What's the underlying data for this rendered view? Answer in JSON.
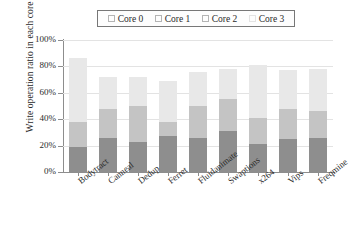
{
  "chart_data": {
    "type": "bar",
    "stacked": true,
    "title": "",
    "xlabel": "",
    "ylabel": "Write operation ratio in each core",
    "ylim": [
      0,
      100
    ],
    "yticks": [
      "0%",
      "20%",
      "40%",
      "60%",
      "80%",
      "100%"
    ],
    "grid": true,
    "legend_position": "top",
    "categories": [
      "Bodytract",
      "Canneal",
      "Dedup",
      "Ferret",
      "Fluidanimate",
      "Swaptions",
      "x264",
      "Vips",
      "Freqmine"
    ],
    "series": [
      {
        "name": "Core 0",
        "color": "#8e8e8e",
        "values": [
          19,
          26,
          23,
          27,
          26,
          31,
          21,
          25,
          26
        ]
      },
      {
        "name": "Core 1",
        "color": "#c4c4c4",
        "values": [
          19,
          22,
          27,
          11,
          24,
          24,
          20,
          23,
          20
        ]
      },
      {
        "name": "Core 2",
        "color": "#e8e8e8",
        "values": [
          48,
          24,
          22,
          31,
          26,
          23,
          40,
          29,
          32
        ]
      },
      {
        "name": "Core 3",
        "color": "#fbfbfb",
        "values": [
          0,
          0,
          0,
          0,
          0,
          0,
          0,
          0,
          0
        ]
      }
    ],
    "totals": [
      86,
      72,
      72,
      69,
      76,
      78,
      81,
      77,
      78
    ]
  },
  "legend": {
    "items": [
      {
        "label": "Core 0",
        "swatch": "legend-swatch-core-0"
      },
      {
        "label": "Core 1",
        "swatch": "legend-swatch-core-1"
      },
      {
        "label": "Core 2",
        "swatch": "legend-swatch-core-2"
      },
      {
        "label": "Core 3",
        "swatch": "legend-swatch-core-3"
      }
    ]
  },
  "axes": {
    "y_title": "Write operation ratio in each core",
    "y_ticks": [
      "100%",
      "80%",
      "60%",
      "40%",
      "20%",
      "0%"
    ],
    "x_labels": [
      "Bodytract",
      "Canneal",
      "Dedup",
      "Ferret",
      "Fluidanimate",
      "Swaptions",
      "x264",
      "Vips",
      "Freqmine"
    ]
  }
}
